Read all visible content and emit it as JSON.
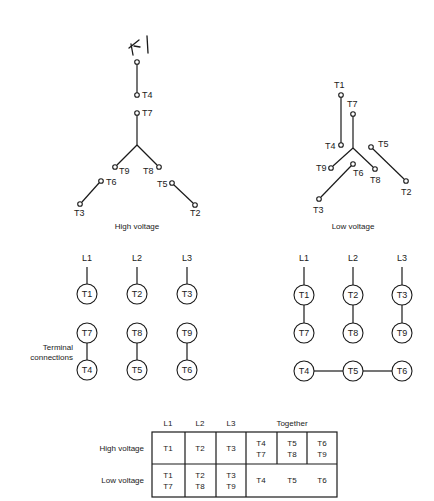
{
  "colors": {
    "ink": "#1a1a1a",
    "background": "#ffffff"
  },
  "annotation": {
    "handwritten": "T1"
  },
  "high_voltage_wye": {
    "caption": "High voltage",
    "terminals": {
      "T4": "T4",
      "T7": "T7",
      "T9": "T9",
      "T8": "T8",
      "T6": "T6",
      "T5": "T5",
      "T3": "T3",
      "T2": "T2"
    }
  },
  "low_voltage_wye": {
    "caption": "Low voltage",
    "terminals": {
      "T1": "T1",
      "T7": "T7",
      "T4": "T4",
      "T5": "T5",
      "T9": "T9",
      "T6": "T6",
      "T8": "T8",
      "T3": "T3",
      "T2": "T2"
    }
  },
  "high_voltage_connections": {
    "side_label_line1": "Terminal",
    "side_label_line2": "connections",
    "lines": [
      "L1",
      "L2",
      "L3"
    ],
    "row1": [
      "T1",
      "T2",
      "T3"
    ],
    "row2": [
      "T7",
      "T8",
      "T9"
    ],
    "row3": [
      "T4",
      "T5",
      "T6"
    ]
  },
  "low_voltage_connections": {
    "lines": [
      "L1",
      "L2",
      "L3"
    ],
    "row1": [
      "T1",
      "T2",
      "T3"
    ],
    "row2": [
      "T7",
      "T8",
      "T9"
    ],
    "row3": [
      "T4",
      "T5",
      "T6"
    ]
  },
  "table": {
    "headers": [
      "L1",
      "L2",
      "L3",
      "Together"
    ],
    "rows": [
      {
        "label": "High voltage",
        "L1": [
          "T1"
        ],
        "L2": [
          "T2"
        ],
        "L3": [
          "T3"
        ],
        "together": [
          [
            "T4",
            "T7"
          ],
          [
            "T5",
            "T8"
          ],
          [
            "T6",
            "T9"
          ]
        ]
      },
      {
        "label": "Low voltage",
        "L1": [
          "T1",
          "T7"
        ],
        "L2": [
          "T2",
          "T8"
        ],
        "L3": [
          "T3",
          "T9"
        ],
        "together": [
          [
            "T4"
          ],
          [
            "T5"
          ],
          [
            "T6"
          ]
        ]
      }
    ]
  }
}
